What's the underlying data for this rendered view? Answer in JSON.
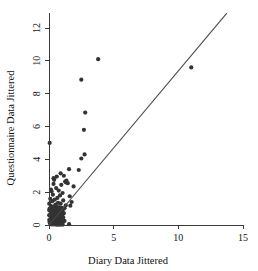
{
  "chart_data": {
    "type": "scatter",
    "title": "",
    "xlabel": "Diary Data Jittered",
    "ylabel": "Questionnaire Data Jittered",
    "xlim": [
      0,
      15
    ],
    "ylim": [
      0,
      12.9
    ],
    "xticks": [
      0,
      5,
      10,
      15
    ],
    "yticks": [
      0,
      2,
      4,
      6,
      8,
      10,
      12
    ],
    "xtick_labels": [
      "0",
      "5",
      "10",
      "15"
    ],
    "ytick_labels": [
      "0",
      "2",
      "4",
      "6",
      "8",
      "10",
      "12"
    ],
    "grid": false,
    "legend": null,
    "marker": {
      "shape": "circle",
      "size_px": 2.1,
      "color": "#333333"
    },
    "reference_line": {
      "description": "identity-style diagonal reference line",
      "x_start": 0.0,
      "y_start": 0.0,
      "x_end": 13.75,
      "y_end": 12.9,
      "slope": 0.938,
      "intercept": 0.0,
      "color": "#4a4a4a"
    },
    "series": [
      {
        "name": "observations",
        "points": [
          [
            3.8,
            10.1
          ],
          [
            11.0,
            9.6
          ],
          [
            2.5,
            8.85
          ],
          [
            2.8,
            6.85
          ],
          [
            2.7,
            5.8
          ],
          [
            0.05,
            5.0
          ],
          [
            2.75,
            4.3
          ],
          [
            2.5,
            4.05
          ],
          [
            1.55,
            3.4
          ],
          [
            2.3,
            3.35
          ],
          [
            0.9,
            3.15
          ],
          [
            1.15,
            3.0
          ],
          [
            0.6,
            2.95
          ],
          [
            0.35,
            2.85
          ],
          [
            0.4,
            2.75
          ],
          [
            1.35,
            2.7
          ],
          [
            1.25,
            2.65
          ],
          [
            1.3,
            2.6
          ],
          [
            1.45,
            2.55
          ],
          [
            0.35,
            2.5
          ],
          [
            0.95,
            2.45
          ],
          [
            1.9,
            2.35
          ],
          [
            0.55,
            2.25
          ],
          [
            0.15,
            2.15
          ],
          [
            0.75,
            2.1
          ],
          [
            0.2,
            2.05
          ],
          [
            1.05,
            1.95
          ],
          [
            0.3,
            1.85
          ],
          [
            0.85,
            1.8
          ],
          [
            1.6,
            1.75
          ],
          [
            0.65,
            1.65
          ],
          [
            0.1,
            1.6
          ],
          [
            0.45,
            1.55
          ],
          [
            1.1,
            1.5
          ],
          [
            0.25,
            1.45
          ],
          [
            1.75,
            1.4
          ],
          [
            0.7,
            1.35
          ],
          [
            0.9,
            1.3
          ],
          [
            0.5,
            1.25
          ],
          [
            1.3,
            1.2
          ],
          [
            1.65,
            1.18
          ],
          [
            0.15,
            1.15
          ],
          [
            0.35,
            1.12
          ],
          [
            0.6,
            1.1
          ],
          [
            0.8,
            1.08
          ],
          [
            1.0,
            1.05
          ],
          [
            1.2,
            1.02
          ],
          [
            0.05,
            1.0
          ],
          [
            0.25,
            0.98
          ],
          [
            0.45,
            0.95
          ],
          [
            0.65,
            0.92
          ],
          [
            0.85,
            0.9
          ],
          [
            1.05,
            0.88
          ],
          [
            0.1,
            0.85
          ],
          [
            0.3,
            0.82
          ],
          [
            0.5,
            0.8
          ],
          [
            0.7,
            0.78
          ],
          [
            0.9,
            0.75
          ],
          [
            1.15,
            0.72
          ],
          [
            0.2,
            0.7
          ],
          [
            0.4,
            0.68
          ],
          [
            0.6,
            0.65
          ],
          [
            0.8,
            0.62
          ],
          [
            1.0,
            0.6
          ],
          [
            0.05,
            0.58
          ],
          [
            0.25,
            0.55
          ],
          [
            0.45,
            0.52
          ],
          [
            0.65,
            0.5
          ],
          [
            0.85,
            0.48
          ],
          [
            1.1,
            0.46
          ],
          [
            0.15,
            0.44
          ],
          [
            0.35,
            0.42
          ],
          [
            0.55,
            0.4
          ],
          [
            0.75,
            0.38
          ],
          [
            0.95,
            0.36
          ],
          [
            0.1,
            0.34
          ],
          [
            0.3,
            0.32
          ],
          [
            0.5,
            0.3
          ],
          [
            0.7,
            0.28
          ],
          [
            0.9,
            0.26
          ],
          [
            1.2,
            0.25
          ],
          [
            0.2,
            0.24
          ],
          [
            0.4,
            0.22
          ],
          [
            0.6,
            0.2
          ],
          [
            0.8,
            0.19
          ],
          [
            1.0,
            0.18
          ],
          [
            0.05,
            0.17
          ],
          [
            0.25,
            0.16
          ],
          [
            0.45,
            0.15
          ],
          [
            0.65,
            0.14
          ],
          [
            0.85,
            0.13
          ],
          [
            1.05,
            0.12
          ],
          [
            0.15,
            0.11
          ],
          [
            0.35,
            0.1
          ],
          [
            0.55,
            0.09
          ],
          [
            0.75,
            0.08
          ],
          [
            0.95,
            0.07
          ],
          [
            0.1,
            0.06
          ],
          [
            0.3,
            0.05
          ],
          [
            0.5,
            0.05
          ],
          [
            0.7,
            0.04
          ],
          [
            0.9,
            0.04
          ],
          [
            0.2,
            0.03
          ],
          [
            0.4,
            0.03
          ],
          [
            0.6,
            0.02
          ],
          [
            0.8,
            0.02
          ],
          [
            1.05,
            0.02
          ],
          [
            1.55,
            0.05
          ],
          [
            0.02,
            0.3
          ],
          [
            0.02,
            0.6
          ],
          [
            0.02,
            0.9
          ],
          [
            0.02,
            1.3
          ]
        ]
      }
    ]
  }
}
